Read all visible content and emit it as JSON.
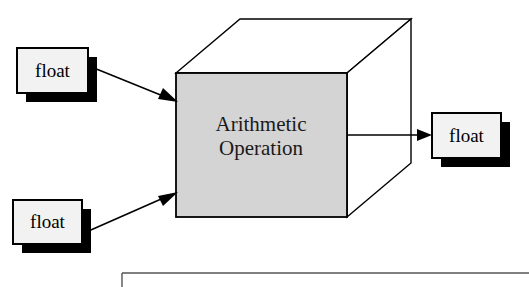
{
  "diagram": {
    "colors": {
      "background": "#ffffff",
      "stroke": "#000000",
      "box_fill": "#f2f2f2",
      "shadow": "#000000",
      "cube_front_fill": "#d4d4d4",
      "cube_top_fill": "#ffffff",
      "cube_side_fill": "#ffffff",
      "frame_stroke": "#555555"
    },
    "process": {
      "name": "arithmetic-operation",
      "label_line1": "Arithmetic",
      "label_line2": "Operation"
    },
    "inputs": [
      {
        "id": "input-float-top",
        "label": "float"
      },
      {
        "id": "input-float-bottom",
        "label": "float"
      }
    ],
    "outputs": [
      {
        "id": "output-float",
        "label": "float"
      }
    ],
    "connectors": [
      {
        "id": "arrow-input-top",
        "from": "input-float-top",
        "to": "arithmetic-operation"
      },
      {
        "id": "arrow-input-bottom",
        "from": "input-float-bottom",
        "to": "arithmetic-operation"
      },
      {
        "id": "arrow-output",
        "from": "arithmetic-operation",
        "to": "output-float"
      }
    ]
  }
}
